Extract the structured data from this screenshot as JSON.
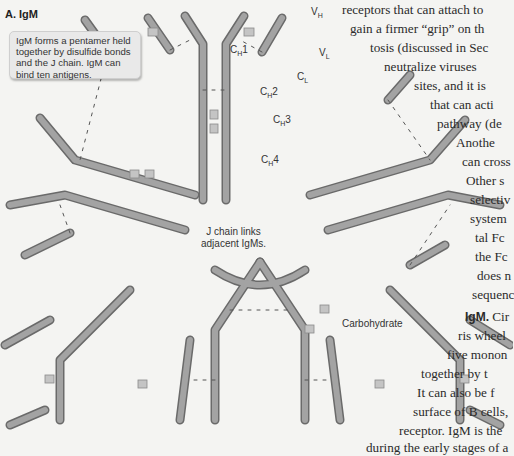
{
  "figure": {
    "title": "A. IgM",
    "callout_text": "IgM forms a pentamer held together by disulfide bonds and the J chain. IgM can bind ten antigens.",
    "labels": {
      "vh": {
        "main": "V",
        "sub": "H"
      },
      "vl": {
        "main": "V",
        "sub": "L"
      },
      "ch1": {
        "main": "C",
        "sub": "H",
        "suffix": "1"
      },
      "cl": {
        "main": "C",
        "sub": "L"
      },
      "ch2": {
        "main": "C",
        "sub": "H",
        "suffix": "2"
      },
      "ch3": {
        "main": "C",
        "sub": "H",
        "suffix": "3"
      },
      "ch4": {
        "main": "C",
        "sub": "H",
        "suffix": "4"
      },
      "j_chain_line1": "J chain links",
      "j_chain_line2": "adjacent IgMs.",
      "carbohydrate": "Carbohydrate",
      "disulfide": "S–S"
    },
    "colors": {
      "background": "#f4f4f2",
      "chain_fill": "#9a9a9a",
      "chain_dark": "#7a7a7a",
      "variable_fill": "#bdbdbd",
      "carbohydrate_fill": "#c7c7c7"
    }
  },
  "prose": {
    "lines": [
      "receptors that can attach to",
      "gain a firmer “grip” on th",
      "tosis (discussed in Sec",
      "neutralize viruses",
      "sites, and it is",
      "that can acti",
      "pathway (de",
      "Anothe",
      "can cross",
      "Other s",
      "selectiv",
      "system",
      "tal Fc",
      "the Fc",
      "does n",
      "sequenc"
    ],
    "igm_heading": "IgM.",
    "igm_lines": [
      "Cir",
      "ris wheel",
      "five monon",
      "together by t",
      "It can also be f",
      "surface of B cells,",
      "receptor. IgM is the",
      "during the early stages of a"
    ]
  }
}
